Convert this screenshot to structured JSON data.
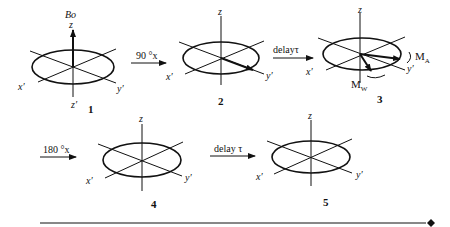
{
  "figure": {
    "panels": [
      {
        "id": "1",
        "number": "1",
        "z": "z",
        "x": "x′",
        "y": "y′",
        "zprime": "z′",
        "field": "Bo",
        "vectors": [
          "M along +z (Bo)"
        ]
      },
      {
        "id": "2",
        "number": "2",
        "z": "z",
        "x": "x′",
        "y": "y′",
        "vectors": [
          "M along y′"
        ]
      },
      {
        "id": "3",
        "number": "3",
        "z": "z",
        "x": "x′",
        "y": "y′",
        "vectors": [
          "MA",
          "MW"
        ],
        "labels": {
          "ma": "M",
          "ma_sub": "A",
          "mw": "M",
          "mw_sub": "W"
        }
      },
      {
        "id": "4",
        "number": "4",
        "z": "z",
        "x": "x′",
        "y": "y′",
        "vectors": []
      },
      {
        "id": "5",
        "number": "5",
        "z": "z",
        "x": "x′",
        "y": "y′",
        "vectors": []
      }
    ],
    "arrows": [
      {
        "label": "90 °x"
      },
      {
        "label": "delayτ"
      },
      {
        "label": "180 °x"
      },
      {
        "label": "delay τ"
      }
    ]
  }
}
